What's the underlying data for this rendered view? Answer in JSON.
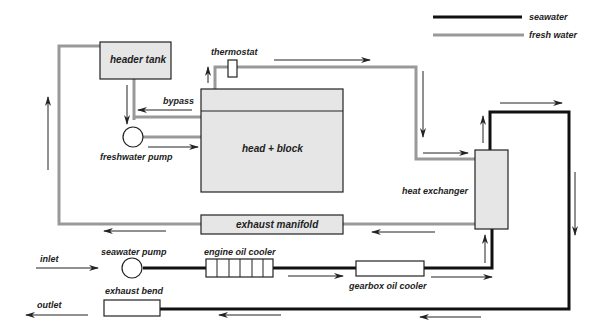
{
  "diagram": {
    "legend": [
      {
        "label": "seawater",
        "color": "#111111",
        "style": "thick-black-line"
      },
      {
        "label": "fresh water",
        "color": "#999999",
        "style": "thick-grey-line"
      }
    ],
    "components": {
      "header_tank": "header tank",
      "thermostat": "thermostat",
      "bypass": "bypass",
      "freshwater_pump": "freshwater pump",
      "head_block": "head + block",
      "heat_exchanger": "heat exchanger",
      "exhaust_manifold": "exhaust manifold",
      "seawater_pump": "seawater pump",
      "engine_oil_cooler": "engine oil cooler",
      "gearbox_oil_cooler": "gearbox oil cooler",
      "exhaust_bend": "exhaust bend",
      "inlet": "inlet",
      "outlet": "outlet"
    },
    "colors": {
      "seawater_pipe": "#111111",
      "freshwater_pipe": "#999999",
      "component_fill": "#e6e6e6",
      "component_stroke": "#222222",
      "arrow": "#222222"
    },
    "flow_sequence": {
      "fresh_water": [
        "header tank",
        "freshwater pump",
        "head + block",
        "thermostat",
        "heat exchanger",
        "exhaust manifold",
        "header tank"
      ],
      "seawater": [
        "inlet",
        "seawater pump",
        "engine oil cooler",
        "gearbox oil cooler",
        "heat exchanger",
        "exhaust bend",
        "outlet"
      ]
    }
  }
}
